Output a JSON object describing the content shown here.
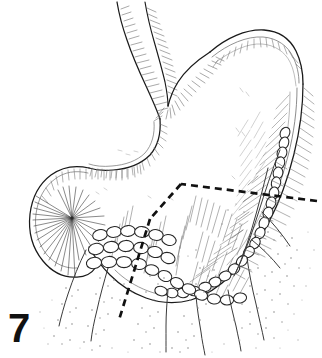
{
  "figure": {
    "number_label": "7",
    "caption_text": "",
    "kind": "anatomical-line-drawing",
    "background_color": "#ffffff",
    "ink_color": "#1a1a1a",
    "light_ink_color": "#6b6b6b",
    "stipple_color": "#8a8a8a",
    "canvas": {
      "width": 322,
      "height": 358
    }
  },
  "structures": {
    "esophagus": {
      "name": "esophagus",
      "label": "",
      "outline_path": "M 118 2 L 122 18 L 128 42 L 137 70 L 147 96 L 155 116 L 159 130 L 160 140",
      "inner_path": "M 145 2 L 148 20 L 152 42 L 157 62 L 161 80 L 164 96 L 166 108",
      "hatch_count": 44
    },
    "lesser_curvature": {
      "name": "lesser-curvature",
      "outline_path": "M 160 140 C 160 152 156 160 148 164 C 138 169 126 171 114 171 C 104 171 96 170 90 168",
      "hatch_count": 26
    },
    "cardiac_notch": {
      "name": "cardiac-notch",
      "outline_path": "M 166 108 C 168 98 172 86 178 76 C 186 62 198 50 212 42",
      "hatch_count": 22
    },
    "fundus": {
      "name": "fundus",
      "outline_path": "M 212 42 C 230 30 250 24 266 26 C 280 28 290 36 296 48 C 301 58 303 70 303 82",
      "inner_path": "M 214 48 C 232 36 252 30 268 32 C 281 34 291 42 296 54"
    },
    "greater_curvature": {
      "name": "greater-curvature",
      "outline_path": "M 303 82 C 303 104 300 128 294 152 C 288 176 280 200 270 222 C 260 244 248 264 234 278 C 220 292 206 300 192 302",
      "node_chain": true
    },
    "antrum_pylorus": {
      "name": "antrum-and-pylorus",
      "outline_path": "M 192 302 C 176 304 160 302 146 296 C 132 290 120 282 110 272 C 100 262 92 252 86 242",
      "node_chain": true
    },
    "duodenal_bulb": {
      "name": "duodenal-bulb",
      "outline_path": "M 90 168 C 76 166 62 168 52 176 C 40 186 34 200 32 216 C 30 234 34 250 44 262 C 52 272 64 278 76 278 C 84 278 90 274 94 268",
      "fan_origin": {
        "x": 72,
        "y": 218
      },
      "fan_spokes": 30
    }
  },
  "resection_line": {
    "name": "dashed-resection-line",
    "style": "dashed",
    "dash_pattern": "7 5",
    "stroke_width": 2.6,
    "segments": [
      {
        "from": {
          "x": 316,
          "y": 201
        },
        "to": {
          "x": 181,
          "y": 184
        }
      },
      {
        "from": {
          "x": 181,
          "y": 184
        },
        "to": {
          "x": 150,
          "y": 218
        }
      },
      {
        "from": {
          "x": 150,
          "y": 218
        },
        "to": {
          "x": 119,
          "y": 318
        }
      }
    ]
  },
  "omentum": {
    "name": "greater-omentum",
    "hatch_groups": 5,
    "stipple_dot_count": 520,
    "vessel_count": 9
  },
  "lymph_nodes": {
    "name": "lymph-node-chains",
    "chains": [
      {
        "name": "greater-curvature-chain",
        "count": 22
      },
      {
        "name": "pyloric-chain",
        "count": 16
      },
      {
        "name": "subpyloric-chain",
        "count": 12
      }
    ]
  }
}
